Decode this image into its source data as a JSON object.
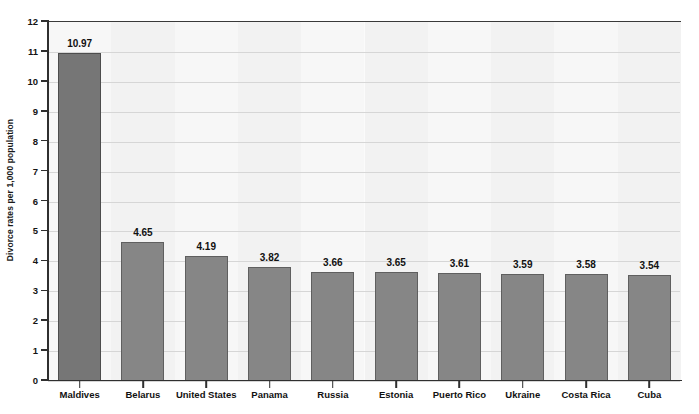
{
  "chart_data": {
    "type": "bar",
    "title": "",
    "xlabel": "",
    "ylabel": "Divorce rates per 1,000 population",
    "ylim": [
      0,
      12
    ],
    "ytick_step": 1,
    "grid": true,
    "legend": "none",
    "orientation": "vertical",
    "categories": [
      "Maldives",
      "Belarus",
      "United States",
      "Panama",
      "Russia",
      "Estonia",
      "Puerto Rico",
      "Ukraine",
      "Costa Rica",
      "Cuba"
    ],
    "values": [
      10.97,
      4.65,
      4.19,
      3.82,
      3.66,
      3.65,
      3.61,
      3.59,
      3.58,
      3.54
    ],
    "value_labels": [
      "10.97",
      "4.65",
      "4.19",
      "3.82",
      "3.66",
      "3.65",
      "3.61",
      "3.59",
      "3.58",
      "3.54"
    ],
    "ytick_labels": [
      "0",
      "1",
      "2",
      "3",
      "4",
      "5",
      "6",
      "7",
      "8",
      "9",
      "10",
      "11",
      "12"
    ],
    "colors": {
      "bar_primary": "#767676",
      "bar_default": "#868686",
      "bar_outline": "#5f5f5f",
      "axis": "#2f2f2f",
      "gridline": "#d6d6d6",
      "plot_background": "#fbfbfb",
      "text": "#111111"
    }
  }
}
